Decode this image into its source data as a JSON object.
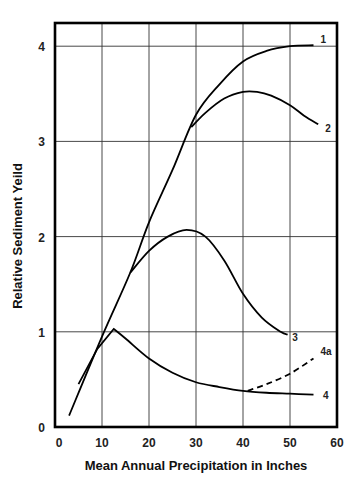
{
  "chart_data": {
    "type": "line",
    "title": "",
    "xlabel": "Mean Annual Precipitation in Inches",
    "ylabel": "Relative Sediment Yeild",
    "xlim": [
      0,
      60
    ],
    "ylim": [
      0,
      4.3
    ],
    "x_ticks": [
      "0",
      "10",
      "20",
      "30",
      "40",
      "50",
      "60"
    ],
    "y_ticks": [
      "0",
      "1",
      "2",
      "3",
      "4"
    ],
    "grid": true,
    "legend": "inline curve labels",
    "series": [
      {
        "name": "1",
        "style": "solid",
        "x": [
          3,
          10,
          16,
          20,
          25,
          30,
          35,
          40,
          45,
          50,
          55
        ],
        "y": [
          0.12,
          0.95,
          1.62,
          2.15,
          2.7,
          3.28,
          3.6,
          3.84,
          3.95,
          4.0,
          4.01
        ]
      },
      {
        "name": "2",
        "style": "solid",
        "x": [
          29,
          32,
          36,
          40,
          43,
          46,
          50,
          53,
          56
        ],
        "y": [
          3.15,
          3.3,
          3.45,
          3.52,
          3.52,
          3.48,
          3.38,
          3.27,
          3.18
        ]
      },
      {
        "name": "3",
        "style": "solid",
        "x": [
          16,
          20,
          24,
          28,
          32,
          36,
          40,
          44,
          48,
          49.5
        ],
        "y": [
          1.62,
          1.85,
          2.0,
          2.07,
          2.0,
          1.75,
          1.4,
          1.15,
          1.0,
          0.97
        ]
      },
      {
        "name": "4",
        "style": "solid",
        "x": [
          5,
          9,
          12.5,
          15,
          20,
          25,
          30,
          35,
          40,
          45,
          50,
          55
        ],
        "y": [
          0.45,
          0.82,
          1.03,
          0.93,
          0.72,
          0.57,
          0.47,
          0.42,
          0.38,
          0.36,
          0.35,
          0.34
        ]
      },
      {
        "name": "4a",
        "style": "dashed",
        "x": [
          41,
          45,
          50,
          55
        ],
        "y": [
          0.38,
          0.45,
          0.56,
          0.72
        ]
      }
    ]
  },
  "labels": {
    "xlabel": "Mean Annual Precipitation in Inches",
    "ylabel": "Relative Sediment Yeild"
  }
}
